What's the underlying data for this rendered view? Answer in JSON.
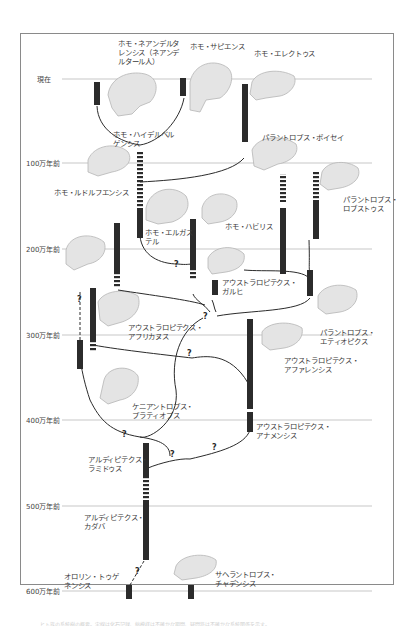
{
  "diagram": {
    "time_axis": {
      "ticks": [
        {
          "label": "現在",
          "y": 79
        },
        {
          "label": "100万年前",
          "y": 163
        },
        {
          "label": "200万年前",
          "y": 249
        },
        {
          "label": "300万年前",
          "y": 335
        },
        {
          "label": "400万年前",
          "y": 420
        },
        {
          "label": "500万年前",
          "y": 506
        },
        {
          "label": "600万年前",
          "y": 591
        }
      ]
    },
    "species": [
      {
        "id": "neanderthalensis",
        "label": "ホモ・ネアンデルタ\nレンシス（ネアンデ\nルタール人）"
      },
      {
        "id": "sapiens",
        "label": "ホモ・サピエンス"
      },
      {
        "id": "erectus",
        "label": "ホモ・エレクトゥス"
      },
      {
        "id": "heidelbergensis",
        "label": "ホモ・ハイデルベル\nゲンシス"
      },
      {
        "id": "boisei",
        "label": "パラントロプス・ボイセイ"
      },
      {
        "id": "rudolfensis",
        "label": "ホモ・ルドルフエンシス"
      },
      {
        "id": "robustus",
        "label": "パラントロプス・\nロブストゥス"
      },
      {
        "id": "ergaster",
        "label": "ホモ・エルガス\nテル"
      },
      {
        "id": "habilis",
        "label": "ホモ・ハビリス"
      },
      {
        "id": "garhi",
        "label": "アウストラロピテクス・\nガルヒ"
      },
      {
        "id": "africanus",
        "label": "アウストラロピテクス・\nアフリカヌス"
      },
      {
        "id": "aethiopicus",
        "label": "パラントロプス・\nエティオピクス"
      },
      {
        "id": "afarensis",
        "label": "アウストラロピテクス・\nアファレンシス"
      },
      {
        "id": "platyops",
        "label": "ケニアントロプス・\nプラティオプス"
      },
      {
        "id": "anamensis",
        "label": "アウストラロピテクス・\nアナメンシス"
      },
      {
        "id": "ramidus",
        "label": "アルディピテクス・\nラミドゥス"
      },
      {
        "id": "kadabba",
        "label": "アルディピテクス・\nカダバ"
      },
      {
        "id": "tugenensis",
        "label": "オロリン・トゥゲ\nネンシス"
      },
      {
        "id": "tchadensis",
        "label": "サヘラントロプス・\nチャデンシス"
      }
    ],
    "uncertain_marker": "?",
    "colors": {
      "bar": "#2b2b2b",
      "timeline": "#c8c8c8",
      "skull_fill": "#e4e4e4",
      "skull_stroke": "#b5b5b5",
      "branch": "#2b2b2b",
      "frame": "#8a8a8a"
    }
  },
  "footer": {
    "text": "ヒト族の系統樹の概要。実線は化石記録、縞模様は不確かな期間、疑問符は不確かな系統関係を示す。"
  }
}
